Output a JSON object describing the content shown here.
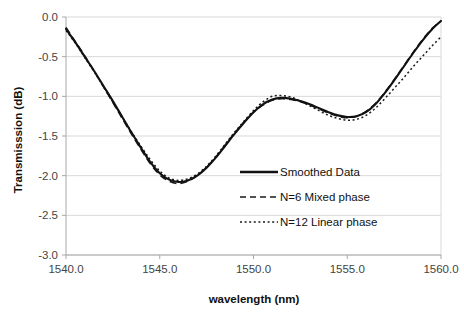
{
  "chart_data": {
    "type": "line",
    "title": "",
    "xlabel": "wavelength (nm)",
    "ylabel": "Transmisssion (dB)",
    "xlim": [
      1540.0,
      1560.0
    ],
    "ylim": [
      -3.0,
      0.0
    ],
    "xticks": [
      "1540.0",
      "1545.0",
      "1550.0",
      "1555.0",
      "1560.0"
    ],
    "xtick_values": [
      1540.0,
      1545.0,
      1550.0,
      1555.0,
      1560.0
    ],
    "yticks": [
      "0.0",
      "-0.5",
      "-1.0",
      "-1.5",
      "-2.0",
      "-2.5",
      "-3.0"
    ],
    "ytick_values": [
      0.0,
      -0.5,
      -1.0,
      -1.5,
      -2.0,
      -2.5,
      -3.0
    ],
    "grid": true,
    "legend_position": "inside-lower-right",
    "x": [
      1540.0,
      1540.5,
      1541.0,
      1541.5,
      1542.0,
      1542.5,
      1543.0,
      1543.5,
      1544.0,
      1544.5,
      1545.0,
      1545.5,
      1546.0,
      1546.5,
      1547.0,
      1547.5,
      1548.0,
      1548.5,
      1549.0,
      1549.5,
      1550.0,
      1550.5,
      1551.0,
      1551.5,
      1552.0,
      1552.5,
      1553.0,
      1553.5,
      1554.0,
      1554.5,
      1555.0,
      1555.5,
      1556.0,
      1556.5,
      1557.0,
      1557.5,
      1558.0,
      1558.5,
      1559.0,
      1559.5,
      1560.0
    ],
    "series": [
      {
        "name": "Smoothed Data",
        "style": "solid",
        "color": "#111111",
        "values": [
          -0.15,
          -0.32,
          -0.5,
          -0.68,
          -0.87,
          -1.06,
          -1.26,
          -1.46,
          -1.65,
          -1.83,
          -1.97,
          -2.05,
          -2.08,
          -2.06,
          -2.0,
          -1.9,
          -1.77,
          -1.62,
          -1.47,
          -1.33,
          -1.2,
          -1.1,
          -1.04,
          -1.02,
          -1.03,
          -1.06,
          -1.1,
          -1.15,
          -1.2,
          -1.24,
          -1.26,
          -1.25,
          -1.2,
          -1.1,
          -0.96,
          -0.8,
          -0.63,
          -0.46,
          -0.3,
          -0.16,
          -0.05
        ]
      },
      {
        "name": "N=6 Mixed phase",
        "style": "dashed",
        "color": "#1a1a1a",
        "values": [
          -0.13,
          -0.31,
          -0.49,
          -0.68,
          -0.88,
          -1.08,
          -1.28,
          -1.48,
          -1.67,
          -1.85,
          -1.99,
          -2.07,
          -2.1,
          -2.07,
          -2.0,
          -1.89,
          -1.76,
          -1.61,
          -1.46,
          -1.32,
          -1.2,
          -1.11,
          -1.05,
          -1.03,
          -1.04,
          -1.07,
          -1.11,
          -1.16,
          -1.21,
          -1.25,
          -1.27,
          -1.25,
          -1.19,
          -1.09,
          -0.95,
          -0.79,
          -0.62,
          -0.45,
          -0.29,
          -0.15,
          -0.05
        ]
      },
      {
        "name": "N=12 Linear phase",
        "style": "dotted",
        "color": "#1a1a1a",
        "values": [
          -0.17,
          -0.33,
          -0.51,
          -0.69,
          -0.88,
          -1.07,
          -1.26,
          -1.45,
          -1.63,
          -1.8,
          -1.94,
          -2.03,
          -2.06,
          -2.04,
          -1.98,
          -1.88,
          -1.75,
          -1.6,
          -1.45,
          -1.31,
          -1.18,
          -1.07,
          -1.0,
          -0.99,
          -1.01,
          -1.06,
          -1.12,
          -1.18,
          -1.24,
          -1.28,
          -1.3,
          -1.29,
          -1.24,
          -1.15,
          -1.03,
          -0.9,
          -0.77,
          -0.63,
          -0.5,
          -0.37,
          -0.25
        ]
      }
    ],
    "legend": [
      {
        "label": "Smoothed Data",
        "style": "solid"
      },
      {
        "label": "N=6 Mixed phase",
        "style": "dashed"
      },
      {
        "label": "N=12 Linear phase",
        "style": "dotted"
      }
    ]
  }
}
